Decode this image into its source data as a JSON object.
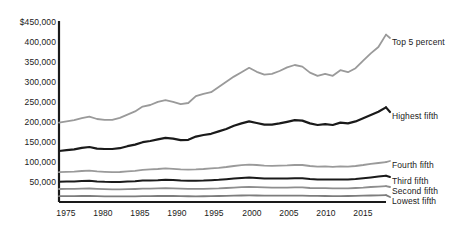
{
  "chart_data": {
    "type": "line",
    "title": "",
    "xlabel": "",
    "ylabel": "",
    "grid": false,
    "legend_position": "right-inline",
    "xlim": [
      1975,
      2018
    ],
    "ylim": [
      0,
      450000
    ],
    "x_ticks": [
      "1975",
      "1980",
      "1985",
      "1990",
      "1995",
      "2000",
      "2005",
      "2010",
      "2015"
    ],
    "x_tick_values": [
      1975,
      1980,
      1985,
      1990,
      1995,
      2000,
      2005,
      2010,
      2015
    ],
    "y_ticks": [
      "$450,000",
      "400,000",
      "350,000",
      "300,000",
      "250,000",
      "200,000",
      "150,000",
      "100,000",
      "50,000"
    ],
    "y_tick_values": [
      450000,
      400000,
      350000,
      300000,
      250000,
      200000,
      150000,
      100000,
      50000
    ],
    "x": [
      1975,
      1976,
      1977,
      1978,
      1979,
      1980,
      1981,
      1982,
      1983,
      1984,
      1985,
      1986,
      1987,
      1988,
      1989,
      1990,
      1991,
      1992,
      1993,
      1994,
      1995,
      1996,
      1997,
      1998,
      1999,
      2000,
      2001,
      2002,
      2003,
      2004,
      2005,
      2006,
      2007,
      2008,
      2009,
      2010,
      2011,
      2012,
      2013,
      2014,
      2015,
      2016,
      2017,
      2018
    ],
    "series": [
      {
        "name": "Top 5 percent",
        "color": "#9a9a9a",
        "width": 1.8,
        "values": [
          196000,
          199000,
          202000,
          207000,
          211000,
          205000,
          203000,
          203000,
          208000,
          216000,
          224000,
          236000,
          240000,
          248000,
          252000,
          248000,
          242000,
          245000,
          262000,
          268000,
          272000,
          285000,
          298000,
          311000,
          322000,
          333000,
          323000,
          316000,
          318000,
          325000,
          334000,
          340000,
          336000,
          321000,
          313000,
          318000,
          313000,
          327000,
          322000,
          332000,
          351000,
          369000,
          385000,
          416000
        ]
      },
      {
        "name": "Highest fifth",
        "color": "#1a1a1a",
        "width": 2.2,
        "values": [
          125000,
          127000,
          129000,
          133000,
          135000,
          131000,
          130000,
          130000,
          132000,
          137000,
          141000,
          147000,
          150000,
          154000,
          158000,
          156000,
          152000,
          153000,
          161000,
          165000,
          168000,
          174000,
          180000,
          188000,
          194000,
          199000,
          195000,
          191000,
          191000,
          194000,
          198000,
          202000,
          201000,
          194000,
          190000,
          192000,
          190000,
          196000,
          194000,
          199000,
          207000,
          215000,
          223000,
          234000
        ]
      },
      {
        "name": "Fourth fifth",
        "color": "#9a9a9a",
        "width": 1.8,
        "values": [
          72000,
          73000,
          73500,
          75000,
          76000,
          74000,
          73000,
          72000,
          72500,
          74000,
          75500,
          78000,
          79000,
          80000,
          81500,
          80500,
          79000,
          78500,
          79000,
          80000,
          81500,
          83000,
          85000,
          87500,
          89500,
          91000,
          90000,
          88500,
          88000,
          88500,
          89000,
          90000,
          90000,
          87500,
          86000,
          86500,
          85500,
          86500,
          86000,
          87500,
          90000,
          93000,
          95000,
          97000
        ]
      },
      {
        "name": "Third fifth",
        "color": "#1a1a1a",
        "width": 2.0,
        "values": [
          48000,
          48500,
          49000,
          50000,
          50500,
          49000,
          48000,
          47500,
          47500,
          48500,
          49500,
          51000,
          51500,
          52000,
          53000,
          52500,
          51000,
          50500,
          50500,
          51000,
          52000,
          53000,
          54500,
          56000,
          57500,
          58500,
          57500,
          56500,
          56000,
          56000,
          56500,
          57000,
          57000,
          55000,
          54000,
          54000,
          53500,
          54000,
          54000,
          55000,
          57000,
          59000,
          61000,
          63000
        ]
      },
      {
        "name": "Second fifth",
        "color": "#8e8e8e",
        "width": 1.8,
        "values": [
          30000,
          30200,
          30500,
          31000,
          31200,
          30200,
          29500,
          29000,
          29000,
          29500,
          30000,
          30800,
          31000,
          31500,
          32000,
          31500,
          30800,
          30500,
          30200,
          30500,
          31000,
          31500,
          32500,
          33500,
          34500,
          35000,
          34500,
          34000,
          33500,
          33500,
          33500,
          34000,
          34000,
          32500,
          32000,
          32000,
          31500,
          31500,
          31800,
          32500,
          33500,
          35000,
          36000,
          37000
        ]
      },
      {
        "name": "Lowest fifth",
        "color": "#7d7d7d",
        "width": 1.8,
        "values": [
          12000,
          12100,
          12200,
          12500,
          12500,
          12000,
          11700,
          11400,
          11400,
          11600,
          11800,
          12100,
          12300,
          12500,
          12800,
          12500,
          12100,
          11900,
          11700,
          11900,
          12200,
          12500,
          12900,
          13400,
          13800,
          14000,
          13800,
          13500,
          13300,
          13200,
          13300,
          13500,
          13500,
          12900,
          12600,
          12500,
          12300,
          12300,
          12500,
          12800,
          13200,
          13800,
          14200,
          14600
        ]
      }
    ],
    "series_labels": [
      {
        "name": "Top 5 percent",
        "x": 392,
        "y": 41
      },
      {
        "name": "Highest fifth",
        "x": 392,
        "y": 115
      },
      {
        "name": "Fourth fifth",
        "x": 392,
        "y": 164
      },
      {
        "name": "Third fifth",
        "x": 392,
        "y": 180
      },
      {
        "name": "Second fifth",
        "x": 392,
        "y": 190
      },
      {
        "name": "Lowest fifth",
        "x": 392,
        "y": 200
      }
    ]
  }
}
